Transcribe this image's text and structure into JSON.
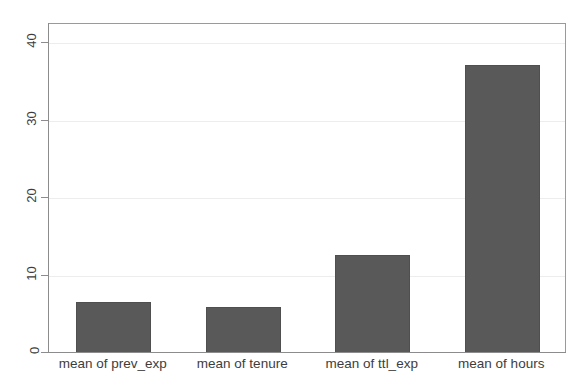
{
  "chart_data": {
    "type": "bar",
    "title": "",
    "subtitle": "",
    "xlabel": "",
    "ylabel": "",
    "categories": [
      "mean of prev_exp",
      "mean of tenure",
      "mean of ttl_exp",
      "mean of hours"
    ],
    "values": [
      6.6,
      5.9,
      12.7,
      37.2
    ],
    "ylim": [
      0,
      42.5
    ],
    "yticks": [
      0,
      10,
      20,
      30,
      40
    ],
    "ytick_labels": [
      "0",
      "10",
      "20",
      "30",
      "40"
    ],
    "xticks_visible": false,
    "grid": true,
    "grid_axis": "y",
    "legend": null,
    "legend_position": "none",
    "bar_color": "#595959",
    "bar_edge_color": "#4f4f4f",
    "grid_color": "#ededed",
    "axis_color": "#8c8c8c",
    "background_color": "#ffffff",
    "text_color": "#3d3d3d",
    "ytick_label_rotation": 90,
    "series": [
      {
        "name": "means",
        "values": [
          6.6,
          5.9,
          12.7,
          37.2
        ]
      }
    ]
  }
}
